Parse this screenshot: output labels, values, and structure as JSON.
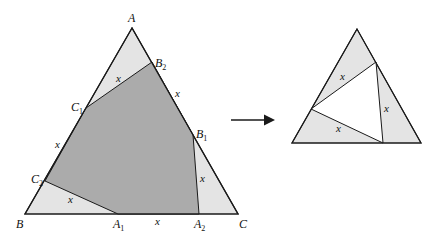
{
  "colors": {
    "light_fill": "#e4e4e4",
    "dark_fill": "#ababab",
    "stroke": "#1a1a1a",
    "background": "#ffffff"
  },
  "left_figure": {
    "vertices": {
      "A": {
        "label": "A",
        "sub": ""
      },
      "B": {
        "label": "B",
        "sub": ""
      },
      "C": {
        "label": "C",
        "sub": ""
      },
      "A1": {
        "label": "A",
        "sub": "1"
      },
      "A2": {
        "label": "A",
        "sub": "2"
      },
      "B1": {
        "label": "B",
        "sub": "1"
      },
      "B2": {
        "label": "B",
        "sub": "2"
      },
      "C1": {
        "label": "C",
        "sub": "1"
      },
      "C2": {
        "label": "C",
        "sub": "2"
      }
    },
    "segment_labels": {
      "corner_A": "x",
      "side_AC": "x",
      "side_AB": "x",
      "corner_C": "x",
      "corner_B": "x",
      "side_BC": "x"
    }
  },
  "arrow": {
    "direction": "right"
  },
  "right_figure": {
    "segment_labels": {
      "top": "x",
      "right": "x",
      "bottom": "x"
    }
  }
}
